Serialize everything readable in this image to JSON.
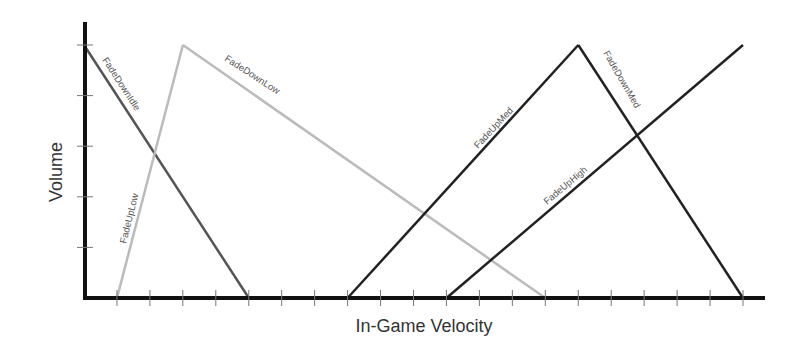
{
  "chart_data": {
    "type": "line",
    "title": "",
    "xlabel": "In-Game Velocity",
    "ylabel": "Volume",
    "x_ticks": [
      1,
      2,
      3,
      4,
      5,
      6,
      7,
      8,
      9,
      10,
      11,
      12,
      13,
      14,
      15,
      16,
      17,
      18,
      19,
      20
    ],
    "y_ticks": [
      0.2,
      0.4,
      0.6,
      0.8,
      1.0
    ],
    "xlim": [
      0,
      21
    ],
    "ylim": [
      0,
      1.1
    ],
    "grid": false,
    "legend": "inline labels along lines",
    "tick_labels_visible": false,
    "series": [
      {
        "name": "FadeDownIdle",
        "color": "#555555",
        "points": [
          [
            0,
            1.0
          ],
          [
            5,
            0.0
          ]
        ]
      },
      {
        "name": "FadeUpLow",
        "color": "#bbbbbb",
        "points": [
          [
            1,
            0.0
          ],
          [
            3,
            1.0
          ]
        ]
      },
      {
        "name": "FadeDownLow",
        "color": "#bbbbbb",
        "points": [
          [
            3,
            1.0
          ],
          [
            14,
            0.0
          ]
        ]
      },
      {
        "name": "FadeUpMed",
        "color": "#222222",
        "points": [
          [
            8,
            0.0
          ],
          [
            15,
            1.0
          ]
        ]
      },
      {
        "name": "FadeDownMed",
        "color": "#222222",
        "points": [
          [
            15,
            1.0
          ],
          [
            20,
            0.0
          ]
        ]
      },
      {
        "name": "FadeUpHigh",
        "color": "#222222",
        "points": [
          [
            11,
            0.0
          ],
          [
            20,
            1.0
          ]
        ]
      }
    ]
  },
  "labels": {
    "xlabel": "In-Game Velocity",
    "ylabel": "Volume",
    "fade_down_idle": "FadeDownIdle",
    "fade_up_low": "FadeUpLow",
    "fade_down_low": "FadeDownLow",
    "fade_up_med": "FadeUpMed",
    "fade_down_med": "FadeDownMed",
    "fade_up_high": "FadeUpHigh"
  }
}
